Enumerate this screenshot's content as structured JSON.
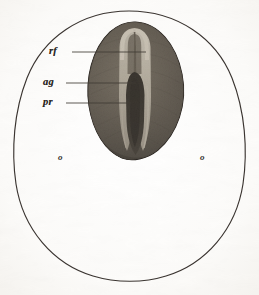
{
  "figure": {
    "medium": "halftone engraving on aged paper",
    "background_color": "#fdfdfc",
    "ink_color": "#2b2724",
    "outline_color": "#3a3430",
    "disc_dark_color": "#3c3832",
    "disc_mid_color": "#5e574e",
    "groove_light_color": "#d8d2c6",
    "streak_dark_color": "#1d1a17"
  },
  "outer_shape": {
    "name": "ovum-outline",
    "description": "thin dark egg-shaped outline, narrow at top, broad rounded base"
  },
  "inner_shape": {
    "name": "embryonic-disc",
    "description": "dark pear-shaped mass with light median groove"
  },
  "labels": [
    {
      "id": "rf",
      "text": "rf",
      "leader": true
    },
    {
      "id": "ag",
      "text": "ag",
      "leader": true
    },
    {
      "id": "pr",
      "text": "pr",
      "leader": true
    }
  ],
  "markers": [
    {
      "id": "o-left",
      "text": "o"
    },
    {
      "id": "o-right",
      "text": "o"
    }
  ]
}
